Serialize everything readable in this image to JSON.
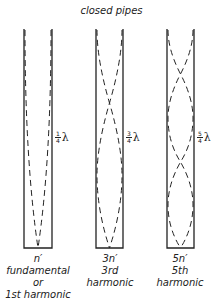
{
  "title": "closed pipes",
  "pipes": [
    {
      "frac_num": "1",
      "frac_den": "4",
      "lambda": "λ",
      "labels": [
        "n′",
        "fundamental",
        "or",
        "1st harmonic"
      ],
      "loops": 1
    },
    {
      "frac_num": "3",
      "frac_den": "4",
      "lambda": "λ",
      "labels": [
        "3n′",
        "3rd",
        "harmonic"
      ],
      "loops": 3
    },
    {
      "frac_num": "5",
      "frac_den": "4",
      "lambda": "λ",
      "labels": [
        "5n′",
        "5th",
        "harmonic"
      ],
      "loops": 5
    }
  ],
  "colors": {
    "ink": "#222222",
    "background": "#ffffff"
  }
}
